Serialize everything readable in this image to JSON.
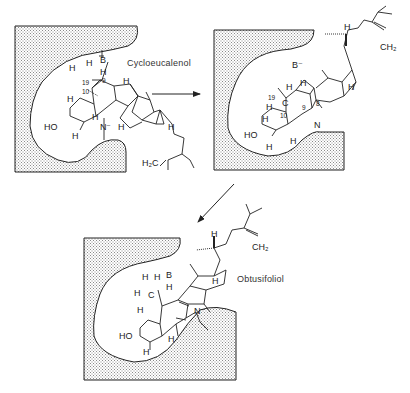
{
  "diagram": {
    "colors": {
      "stroke": "#222222",
      "stipple": "#9a9a9a",
      "background": "#ffffff"
    },
    "panels": [
      {
        "id": "cycloeucalenol",
        "compound_name": "Cycloeucalenol",
        "labels": {
          "base": "B",
          "base_h": "H",
          "h_top": "H",
          "h_left": "H",
          "pos19": "19",
          "pos9": "9",
          "pos10": "10",
          "h_ring_right": "H",
          "h_ringA_top": "H",
          "h_ringA_bottom": "H",
          "h_mid": "H",
          "hydroxyl": "HO",
          "nucleophile": "N⁻",
          "h_d_ring": "H",
          "h_side": "H",
          "methylene": "H₂C"
        }
      },
      {
        "id": "intermediate",
        "compound_name": "",
        "labels": {
          "base": "B⁻",
          "h_top": "H",
          "h_c19_top": "H",
          "pos19": "19",
          "carbon": "C",
          "h_c19_left": "H",
          "pos10": "10",
          "pos9": "9",
          "pos8": "8",
          "h_ringA_top": "H",
          "h_ringA_bottom": "H",
          "h_mid": "H",
          "hydroxyl": "HO",
          "nucleophile": "N",
          "h_side": "H",
          "h_d_ring": "H",
          "methylene": "CH₂"
        }
      },
      {
        "id": "obtusifoliol",
        "compound_name": "Obtusifoliol",
        "labels": {
          "base": "B",
          "base_h": "H",
          "h_c_top1": "H",
          "h_c_top2": "H",
          "h_c_left": "H",
          "carbon": "C",
          "h_ringA_top": "H",
          "h_ringA_bottom": "H",
          "h_mid": "H",
          "hydroxyl": "HO",
          "nucleophile": "N⁻",
          "h_side": "H",
          "h_d_ring": "H",
          "methylene": "CH₂"
        }
      }
    ],
    "arrows": [
      {
        "from": "cycloeucalenol",
        "to": "intermediate",
        "direction": "right"
      },
      {
        "from": "intermediate",
        "to": "obtusifoliol",
        "direction": "down-left"
      }
    ]
  }
}
